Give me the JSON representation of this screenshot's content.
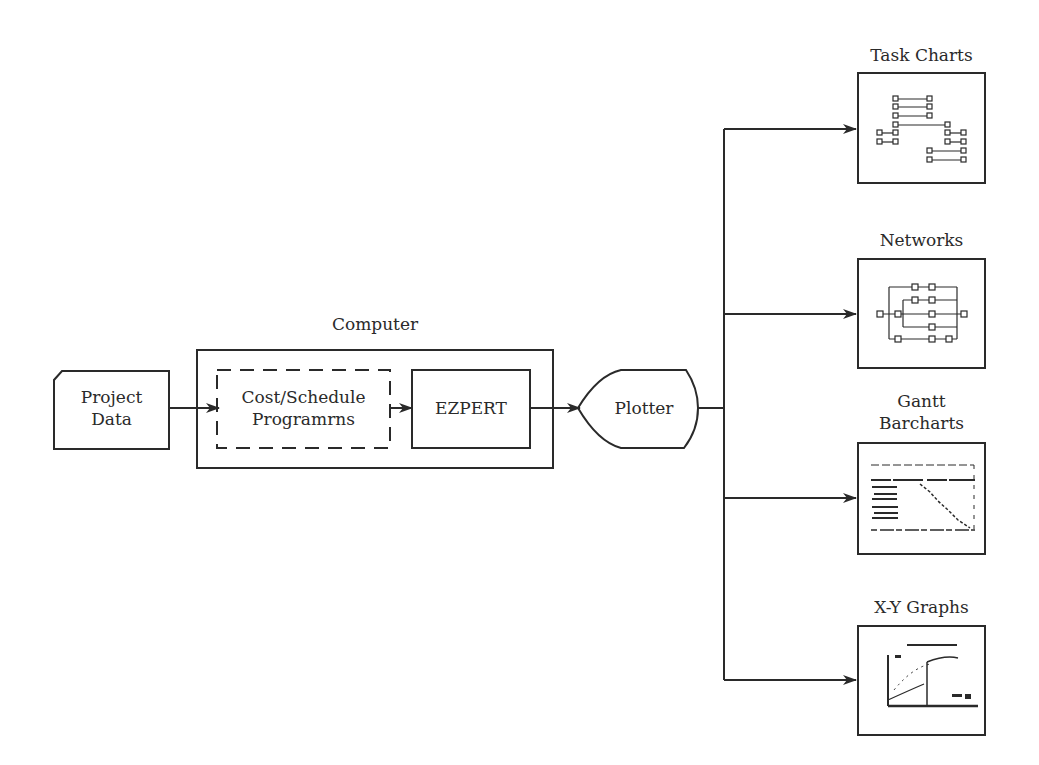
{
  "diagram": {
    "type": "flowchart",
    "nodes": {
      "project_data": {
        "label_line1": "Project",
        "label_line2": "Data",
        "shape": "card"
      },
      "computer": {
        "label": "Computer",
        "shape": "container"
      },
      "cost_schedule": {
        "label_line1": "Cost/Schedule",
        "label_line2": "Programrns",
        "shape": "dashed-rect"
      },
      "ezpert": {
        "label": "EZPERT",
        "shape": "rect"
      },
      "plotter": {
        "label": "Plotter",
        "shape": "display"
      },
      "task_charts": {
        "label": "Task Charts",
        "shape": "rect-thumbnail"
      },
      "networks": {
        "label": "Networks",
        "shape": "rect-thumbnail"
      },
      "gantt": {
        "label_line1": "Gantt",
        "label_line2": "Barcharts",
        "shape": "rect-thumbnail"
      },
      "xy_graphs": {
        "label": "X-Y Graphs",
        "shape": "rect-thumbnail"
      }
    },
    "edges": [
      {
        "from": "Project Data",
        "to": "Cost/Schedule Programrns"
      },
      {
        "from": "Cost/Schedule Programrns",
        "to": "EZPERT"
      },
      {
        "from": "EZPERT",
        "to": "Plotter"
      },
      {
        "from": "Plotter",
        "to": "Task Charts"
      },
      {
        "from": "Plotter",
        "to": "Networks"
      },
      {
        "from": "Plotter",
        "to": "Gantt Barcharts"
      },
      {
        "from": "Plotter",
        "to": "X-Y Graphs"
      }
    ],
    "colors": {
      "stroke": "#2a2a2a",
      "background": "#ffffff"
    }
  }
}
